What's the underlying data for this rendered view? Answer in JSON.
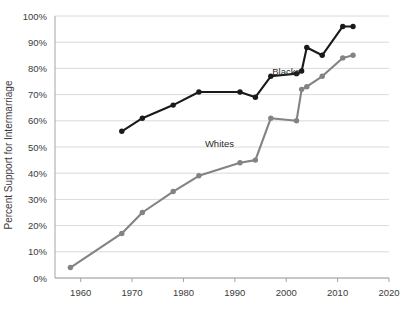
{
  "chart_data": {
    "type": "line",
    "title": "",
    "xlabel": "",
    "ylabel": "Percent Support for Intermarriage",
    "xlim": [
      1955,
      2020
    ],
    "ylim": [
      0,
      100
    ],
    "grid": true,
    "legend_position": "inline-annotation",
    "x_tick_labels": [
      "1960",
      "1970",
      "1980",
      "1990",
      "2000",
      "2010",
      "2020"
    ],
    "x_ticks": [
      1960,
      1970,
      1980,
      1990,
      2000,
      2010,
      2020
    ],
    "y_tick_labels": [
      "0%",
      "10%",
      "20%",
      "30%",
      "40%",
      "50%",
      "60%",
      "70%",
      "80%",
      "90%",
      "100%"
    ],
    "y_ticks": [
      0,
      10,
      20,
      30,
      40,
      50,
      60,
      70,
      80,
      90,
      100
    ],
    "series": [
      {
        "name": "Blacks",
        "color": "#1a1a1a",
        "label_x": 2000,
        "label_y": 77.5,
        "points": [
          {
            "x": 1968,
            "y": 56
          },
          {
            "x": 1972,
            "y": 61
          },
          {
            "x": 1978,
            "y": 66
          },
          {
            "x": 1983,
            "y": 71
          },
          {
            "x": 1991,
            "y": 71
          },
          {
            "x": 1994,
            "y": 69
          },
          {
            "x": 1997,
            "y": 77
          },
          {
            "x": 2002,
            "y": 78
          },
          {
            "x": 2003,
            "y": 79
          },
          {
            "x": 2004,
            "y": 88
          },
          {
            "x": 2007,
            "y": 85
          },
          {
            "x": 2011,
            "y": 96
          },
          {
            "x": 2013,
            "y": 96
          }
        ]
      },
      {
        "name": "Whites",
        "color": "#838383",
        "label_x": 1987,
        "label_y": 50,
        "points": [
          {
            "x": 1958,
            "y": 4
          },
          {
            "x": 1968,
            "y": 17
          },
          {
            "x": 1972,
            "y": 25
          },
          {
            "x": 1978,
            "y": 33
          },
          {
            "x": 1983,
            "y": 39
          },
          {
            "x": 1991,
            "y": 44
          },
          {
            "x": 1994,
            "y": 45
          },
          {
            "x": 1997,
            "y": 61
          },
          {
            "x": 2002,
            "y": 60
          },
          {
            "x": 2003,
            "y": 72
          },
          {
            "x": 2004,
            "y": 73
          },
          {
            "x": 2007,
            "y": 77
          },
          {
            "x": 2011,
            "y": 84
          },
          {
            "x": 2013,
            "y": 85
          }
        ]
      }
    ]
  }
}
